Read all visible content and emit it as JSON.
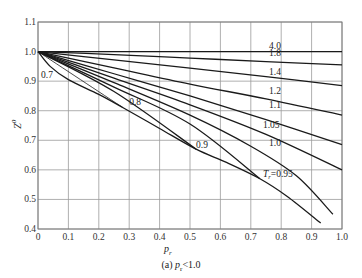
{
  "chart_data": {
    "type": "line",
    "title": "",
    "caption": "(a) pr<1.0",
    "caption_parts": {
      "prefix": "(a) ",
      "var": "p",
      "sub": "r",
      "suffix": "<1.0"
    },
    "xlabel": "pr",
    "ylabel": "Z0",
    "xlim": [
      0,
      1.0
    ],
    "ylim": [
      0.4,
      1.1
    ],
    "xticks": [
      "0",
      "0.1",
      "0.2",
      "0.3",
      "0.4",
      "0.5",
      "0.6",
      "0.7",
      "0.8",
      "0.9",
      "1.0"
    ],
    "yticks": [
      "0.4",
      "0.5",
      "0.6",
      "0.7",
      "0.8",
      "0.9",
      "1.0",
      "1.1"
    ],
    "grid": true,
    "legend": "none (curves labeled inline by reduced temperature Tr)",
    "series": [
      {
        "name": "Tr=4.0",
        "label": "4.0",
        "x": [
          0,
          0.5,
          1.0
        ],
        "y": [
          1.0,
          1.0,
          1.0
        ]
      },
      {
        "name": "Tr=1.8",
        "label": "1.8",
        "x": [
          0,
          0.25,
          0.5,
          0.75,
          1.0
        ],
        "y": [
          1.0,
          0.99,
          0.978,
          0.966,
          0.955
        ]
      },
      {
        "name": "Tr=1.4",
        "label": "1.4",
        "x": [
          0,
          0.25,
          0.5,
          0.75,
          1.0
        ],
        "y": [
          1.0,
          0.972,
          0.944,
          0.915,
          0.885
        ]
      },
      {
        "name": "Tr=1.2",
        "label": "1.2",
        "x": [
          0,
          0.25,
          0.5,
          0.75,
          1.0
        ],
        "y": [
          1.0,
          0.945,
          0.89,
          0.84,
          0.785
        ]
      },
      {
        "name": "Tr=1.1",
        "label": "1.1",
        "x": [
          0,
          0.25,
          0.5,
          0.75,
          1.0
        ],
        "y": [
          1.0,
          0.925,
          0.85,
          0.77,
          0.685
        ]
      },
      {
        "name": "Tr=1.05",
        "label": "1.05",
        "x": [
          0,
          0.25,
          0.5,
          0.75,
          1.0
        ],
        "y": [
          1.0,
          0.91,
          0.82,
          0.72,
          0.6
        ]
      },
      {
        "name": "Tr=1.0",
        "label": "1.0",
        "x": [
          0,
          0.25,
          0.5,
          0.7,
          0.85,
          0.97
        ],
        "y": [
          1.0,
          0.895,
          0.785,
          0.68,
          0.58,
          0.45
        ]
      },
      {
        "name": "Tr=0.95",
        "label": "Tr=0.95",
        "x": [
          0,
          0.25,
          0.5,
          0.73
        ],
        "y": [
          1.0,
          0.88,
          0.755,
          0.57
        ]
      },
      {
        "name": "Tr=0.9",
        "label": "0.9",
        "x": [
          0,
          0.25,
          0.52
        ],
        "y": [
          1.0,
          0.865,
          0.67
        ]
      },
      {
        "name": "Tr=0.8",
        "label": "0.8",
        "x": [
          0,
          0.14,
          0.28
        ],
        "y": [
          1.0,
          0.905,
          0.81
        ]
      },
      {
        "name": "Saturation envelope",
        "label": "",
        "x": [
          0,
          0.04,
          0.1,
          0.2,
          0.28,
          0.4,
          0.52,
          0.62,
          0.73,
          0.82,
          0.93
        ],
        "y": [
          1.0,
          0.95,
          0.905,
          0.855,
          0.81,
          0.74,
          0.67,
          0.625,
          0.57,
          0.51,
          0.42
        ]
      }
    ],
    "annotations": [
      {
        "text": "0.7",
        "x": 0.01,
        "y": 0.91
      },
      {
        "text": "0.8",
        "x": 0.3,
        "y": 0.82
      },
      {
        "text": "0.9",
        "x": 0.52,
        "y": 0.675
      },
      {
        "text": "Tr=0.95",
        "x": 0.74,
        "y": 0.575
      },
      {
        "text": "1.0",
        "x": 0.76,
        "y": 0.68
      },
      {
        "text": "1.05",
        "x": 0.74,
        "y": 0.74
      },
      {
        "text": "1.1",
        "x": 0.76,
        "y": 0.81
      },
      {
        "text": "1.2",
        "x": 0.76,
        "y": 0.855
      },
      {
        "text": "1.4",
        "x": 0.76,
        "y": 0.92
      },
      {
        "text": "1.8",
        "x": 0.76,
        "y": 0.985
      },
      {
        "text": "4.0",
        "x": 0.76,
        "y": 1.01
      }
    ]
  }
}
